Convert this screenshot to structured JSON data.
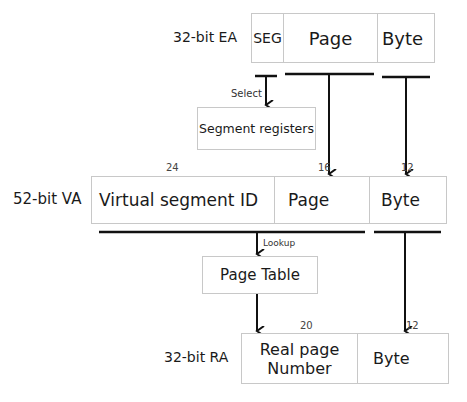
{
  "diagram": {
    "ea": {
      "label": "32-bit EA",
      "fields": [
        "SEG",
        "Page",
        "Byte"
      ]
    },
    "segment_registers": {
      "label": "Segment registers",
      "edge_label": "Select"
    },
    "va": {
      "label": "52-bit VA",
      "fields": [
        "Virtual segment ID",
        "Page",
        "Byte"
      ],
      "bit_widths": [
        "24",
        "16",
        "12"
      ]
    },
    "page_table": {
      "label": "Page Table",
      "edge_label": "Lookup"
    },
    "ra": {
      "label": "32-bit RA",
      "fields": [
        "Real page Number",
        "Byte"
      ],
      "field_lines": [
        "Real page",
        "Number"
      ],
      "bit_widths": [
        "20",
        "12"
      ]
    }
  }
}
